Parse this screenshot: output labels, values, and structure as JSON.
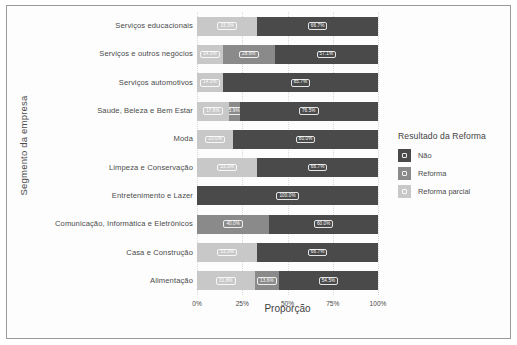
{
  "chart_data": {
    "type": "bar",
    "orientation": "horizontal",
    "stacked": true,
    "normalized": true,
    "title": "",
    "xlabel": "Proporção",
    "ylabel": "Segmento da empresa",
    "xlim": [
      0,
      100
    ],
    "xticks": [
      "0%",
      "25%",
      "50%",
      "75%",
      "100%"
    ],
    "xtick_values": [
      0,
      25,
      50,
      75,
      100
    ],
    "grid": false,
    "legend": {
      "title": "Resultado da Reforma",
      "position": "right",
      "entries": [
        {
          "label": "Não",
          "color": "#4a4a4a"
        },
        {
          "label": "Reforma",
          "color": "#8a8a8a"
        },
        {
          "label": "Reforma parcial",
          "color": "#c8c8c8"
        }
      ]
    },
    "categories": [
      "Serviços educacionais",
      "Serviços e outros negócios",
      "Serviços automotivos",
      "Saude, Beleza e Bem Estar",
      "Moda",
      "Limpeza e Conservação",
      "Entretenimento e Lazer",
      "Comunicação, Informática e Eletrônicos",
      "Casa e Construção",
      "Alimentação"
    ],
    "series": [
      {
        "name": "Reforma parcial",
        "color": "#c8c8c8",
        "values": [
          33.3,
          14.3,
          14.3,
          17.6,
          20.0,
          33.3,
          0,
          0,
          33.3,
          31.8
        ]
      },
      {
        "name": "Reforma",
        "color": "#8a8a8a",
        "values": [
          0,
          28.6,
          0,
          5.9,
          0,
          0,
          0,
          40.0,
          0,
          13.6
        ]
      },
      {
        "name": "Não",
        "color": "#4a4a4a",
        "values": [
          66.7,
          57.1,
          85.7,
          76.5,
          80.0,
          66.7,
          100.0,
          60.0,
          66.7,
          54.5
        ]
      }
    ],
    "rows": [
      {
        "category": "Serviços educacionais",
        "segments": [
          {
            "series": "Reforma parcial",
            "value": 33.3,
            "label": "33.3%",
            "color": "#c8c8c8"
          },
          {
            "series": "Não",
            "value": 66.7,
            "label": "66.7%",
            "color": "#4a4a4a"
          }
        ]
      },
      {
        "category": "Serviços e outros negócios",
        "segments": [
          {
            "series": "Reforma parcial",
            "value": 14.3,
            "label": "14.3%",
            "color": "#c8c8c8"
          },
          {
            "series": "Reforma",
            "value": 28.6,
            "label": "28.6%",
            "color": "#8a8a8a"
          },
          {
            "series": "Não",
            "value": 57.1,
            "label": "57.1%",
            "color": "#4a4a4a"
          }
        ]
      },
      {
        "category": "Serviços automotivos",
        "segments": [
          {
            "series": "Reforma parcial",
            "value": 14.3,
            "label": "14.3%",
            "color": "#c8c8c8"
          },
          {
            "series": "Não",
            "value": 85.7,
            "label": "85.7%",
            "color": "#4a4a4a"
          }
        ]
      },
      {
        "category": "Saude, Beleza e Bem Estar",
        "segments": [
          {
            "series": "Reforma parcial",
            "value": 17.6,
            "label": "17.6%",
            "color": "#c8c8c8"
          },
          {
            "series": "Reforma",
            "value": 5.9,
            "label": "5.9%",
            "color": "#8a8a8a"
          },
          {
            "series": "Não",
            "value": 76.5,
            "label": "76.5%",
            "color": "#4a4a4a"
          }
        ]
      },
      {
        "category": "Moda",
        "segments": [
          {
            "series": "Reforma parcial",
            "value": 20.0,
            "label": "20.0%",
            "color": "#c8c8c8"
          },
          {
            "series": "Não",
            "value": 80.0,
            "label": "80.0%",
            "color": "#4a4a4a"
          }
        ]
      },
      {
        "category": "Limpeza e Conservação",
        "segments": [
          {
            "series": "Reforma parcial",
            "value": 33.3,
            "label": "33.3%",
            "color": "#c8c8c8"
          },
          {
            "series": "Não",
            "value": 66.7,
            "label": "66.7%",
            "color": "#4a4a4a"
          }
        ]
      },
      {
        "category": "Entretenimento e Lazer",
        "segments": [
          {
            "series": "Não",
            "value": 100.0,
            "label": "100.0%",
            "color": "#4a4a4a"
          }
        ]
      },
      {
        "category": "Comunicação, Informática e Eletrônicos",
        "segments": [
          {
            "series": "Reforma",
            "value": 40.0,
            "label": "40.0%",
            "color": "#8a8a8a"
          },
          {
            "series": "Não",
            "value": 60.0,
            "label": "60.0%",
            "color": "#4a4a4a"
          }
        ]
      },
      {
        "category": "Casa e Construção",
        "segments": [
          {
            "series": "Reforma parcial",
            "value": 33.3,
            "label": "33.3%",
            "color": "#c8c8c8"
          },
          {
            "series": "Não",
            "value": 66.7,
            "label": "66.7%",
            "color": "#4a4a4a"
          }
        ]
      },
      {
        "category": "Alimentação",
        "segments": [
          {
            "series": "Reforma parcial",
            "value": 31.8,
            "label": "31.8%",
            "color": "#c8c8c8"
          },
          {
            "series": "Reforma",
            "value": 13.6,
            "label": "13.6%",
            "color": "#8a8a8a"
          },
          {
            "series": "Não",
            "value": 54.5,
            "label": "54.5%",
            "color": "#4a4a4a"
          }
        ]
      }
    ]
  }
}
